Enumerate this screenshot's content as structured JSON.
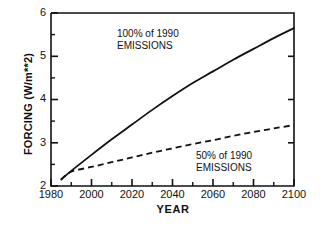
{
  "chart_data": {
    "type": "line",
    "title": "",
    "xlabel": "YEAR",
    "ylabel": "FORCING  (W/m**2)",
    "xlim": [
      1980,
      2100
    ],
    "ylim": [
      2,
      6
    ],
    "xticks": [
      1980,
      2000,
      2020,
      2040,
      2060,
      2080,
      2100
    ],
    "xtick_labels": [
      "1980",
      "2000",
      "2020",
      "2040",
      "2060",
      "2080",
      "2100"
    ],
    "xminor_step": 10,
    "yticks": [
      2,
      3,
      4,
      5,
      6
    ],
    "ytick_labels": [
      "2",
      "3",
      "4",
      "5",
      "6"
    ],
    "yminor_step": 0.5,
    "grid": false,
    "legend_position": "in-plot annotations",
    "series": [
      {
        "name": "100% of 1990 EMISSIONS",
        "style": "solid",
        "color": "#111111",
        "x": [
          1985,
          1990,
          2000,
          2010,
          2020,
          2030,
          2040,
          2050,
          2060,
          2070,
          2080,
          2090,
          2100
        ],
        "values": [
          2.15,
          2.35,
          2.72,
          3.08,
          3.42,
          3.76,
          4.08,
          4.38,
          4.65,
          4.92,
          5.17,
          5.42,
          5.65
        ]
      },
      {
        "name": "50% of 1990 EMISSIONS",
        "style": "dashed",
        "color": "#111111",
        "x": [
          1985,
          1990,
          2000,
          2010,
          2020,
          2030,
          2040,
          2050,
          2060,
          2070,
          2080,
          2090,
          2100
        ],
        "values": [
          2.15,
          2.33,
          2.44,
          2.55,
          2.66,
          2.77,
          2.87,
          2.97,
          3.06,
          3.16,
          3.25,
          3.33,
          3.41
        ]
      }
    ],
    "annotations": [
      {
        "id": "top",
        "line1": "100% of 1990",
        "line2": "EMISSIONS"
      },
      {
        "id": "bottom",
        "line1": "50% of 1990",
        "line2": "EMISSIONS"
      }
    ]
  },
  "colors": {
    "axis": "#111111",
    "curve": "#111111",
    "background": "#ffffff"
  }
}
